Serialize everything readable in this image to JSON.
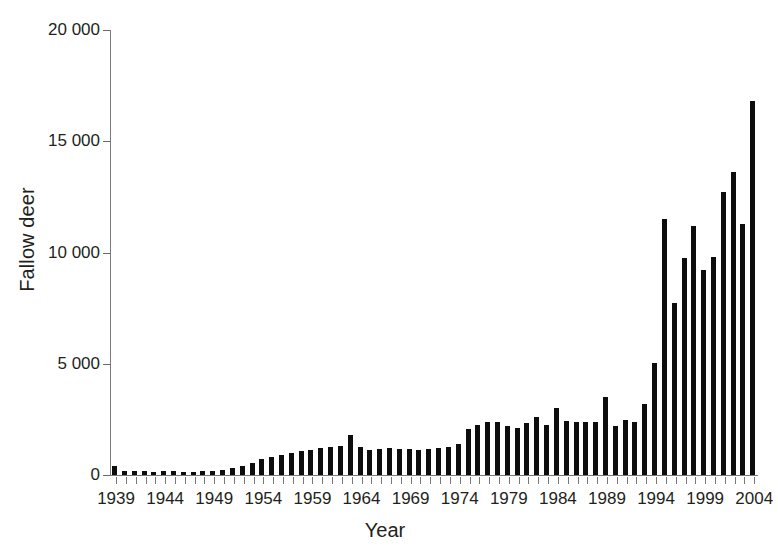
{
  "chart_data": {
    "type": "bar",
    "title": "",
    "xlabel": "Year",
    "ylabel": "Fallow deer",
    "xlim": [
      1938,
      2005
    ],
    "ylim": [
      0,
      20000
    ],
    "grid": false,
    "legend": null,
    "bar_color": "#0d0d0d",
    "axis_color": "#7a7a7a",
    "ytick_labels": [
      "20 000",
      "15 000",
      "10 000",
      "5 000",
      "0"
    ],
    "ytick_values": [
      20000,
      15000,
      10000,
      5000,
      0
    ],
    "xtick_labels": [
      "1939",
      "1944",
      "1949",
      "1954",
      "1959",
      "1964",
      "1969",
      "1974",
      "1979",
      "1984",
      "1989",
      "1994",
      "1999",
      "2004"
    ],
    "xtick_values": [
      1939,
      1944,
      1949,
      1954,
      1959,
      1964,
      1969,
      1974,
      1979,
      1984,
      1989,
      1994,
      1999,
      2004
    ],
    "categories": [
      1939,
      1940,
      1941,
      1942,
      1943,
      1944,
      1945,
      1946,
      1947,
      1948,
      1949,
      1950,
      1951,
      1952,
      1953,
      1954,
      1955,
      1956,
      1957,
      1958,
      1959,
      1960,
      1961,
      1962,
      1963,
      1964,
      1965,
      1966,
      1967,
      1968,
      1969,
      1970,
      1971,
      1972,
      1973,
      1974,
      1975,
      1976,
      1977,
      1978,
      1979,
      1980,
      1981,
      1982,
      1983,
      1984,
      1985,
      1986,
      1987,
      1988,
      1989,
      1990,
      1991,
      1992,
      1993,
      1994,
      1995,
      1996,
      1997,
      1998,
      1999,
      2000,
      2001,
      2002,
      2003,
      2004
    ],
    "values": [
      420,
      200,
      180,
      160,
      150,
      170,
      160,
      150,
      140,
      160,
      190,
      230,
      300,
      390,
      540,
      700,
      830,
      900,
      1000,
      1080,
      1130,
      1230,
      1280,
      1300,
      1800,
      1240,
      1120,
      1180,
      1200,
      1150,
      1180,
      1130,
      1180,
      1230,
      1240,
      1400,
      2050,
      2250,
      2400,
      2400,
      2200,
      2100,
      2350,
      2600,
      2250,
      3000,
      2430,
      2400,
      2400,
      2380,
      3500,
      2220,
      2480,
      2380,
      3200,
      5050,
      11500,
      7750,
      9750,
      11200,
      9200,
      9800,
      12700,
      13600,
      11300,
      16800
    ]
  }
}
